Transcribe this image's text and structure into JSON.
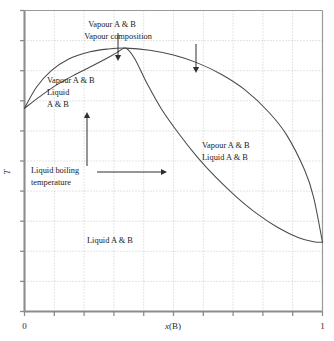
{
  "figure": {
    "kind": "phase-diagram",
    "background": "#ffffff",
    "curve_color": "#4a4a4a",
    "axis_color": "#8c8c8c",
    "grid_color": "#bdbdbd",
    "text_color": "#1a1a1a"
  },
  "axes": {
    "x": {
      "label": "x(B)",
      "label_italic_part": "x",
      "label_rest": "(B)",
      "min_tick_label": "0",
      "max_tick_label": "1",
      "tick_count": 11,
      "tick_values": [
        0,
        0.1,
        0.2,
        0.3,
        0.4,
        0.5,
        0.6,
        0.7,
        0.8,
        0.9,
        1.0
      ]
    },
    "y": {
      "label": "T",
      "tick_count": 11,
      "tick_labels": []
    }
  },
  "annotations": [
    {
      "id": "vapour-ab-top",
      "lines": [
        "Vapour A & B"
      ],
      "x": 112,
      "y": 27,
      "anchor": "middle",
      "arrow": {
        "type": "down",
        "x": 118,
        "y1": 33,
        "y2": 61
      }
    },
    {
      "id": "vapour-composition",
      "lines": [
        "Vapour composition"
      ],
      "x": 118,
      "y": 39,
      "anchor": "middle",
      "arrow": {
        "type": "down",
        "x": 196,
        "y1": 44,
        "y2": 73
      }
    },
    {
      "id": "vapour-liquid-left",
      "lines": [
        "Vapour A & B",
        "Liquid",
        "A & B"
      ],
      "x": 47,
      "y": 83,
      "anchor": "start",
      "arrow": {
        "type": "up",
        "x": 87,
        "y1": 166,
        "y2": 112
      }
    },
    {
      "id": "liquid-boiling-temperature",
      "lines": [
        "Liquid boiling",
        "temperature"
      ],
      "x": 31,
      "y": 173,
      "anchor": "start",
      "arrow": {
        "type": "right",
        "y": 172,
        "x1": 97,
        "x2": 167
      }
    },
    {
      "id": "vapour-liquid-right",
      "lines": [
        "Vapour A & B",
        "Liquid A & B"
      ],
      "x": 202,
      "y": 148,
      "anchor": "start",
      "arrow": null
    },
    {
      "id": "liquid-ab-bottom",
      "lines": [
        "Liquid A & B"
      ],
      "x": 87,
      "y": 243,
      "anchor": "start",
      "arrow": null
    }
  ],
  "chart_data": {
    "type": "line",
    "title": "",
    "xlabel": "x(B)",
    "ylabel": "T",
    "xlim": [
      0,
      1
    ],
    "ylim": [
      0,
      1
    ],
    "grid": true,
    "legend": null,
    "azeotrope": {
      "x": 0.34,
      "label": ""
    },
    "series": [
      {
        "name": "Vapour composition curve",
        "x": [
          0.0,
          0.04,
          0.09,
          0.15,
          0.22,
          0.28,
          0.34,
          0.42,
          0.5,
          0.58,
          0.66,
          0.74,
          0.82,
          0.88,
          0.94,
          0.97,
          1.0
        ],
        "y": [
          0.675,
          0.745,
          0.8,
          0.84,
          0.863,
          0.872,
          0.875,
          0.868,
          0.852,
          0.826,
          0.788,
          0.736,
          0.662,
          0.586,
          0.47,
          0.38,
          0.23
        ]
      },
      {
        "name": "Liquid boiling temperature curve",
        "x": [
          0.0,
          0.05,
          0.1,
          0.16,
          0.22,
          0.27,
          0.31,
          0.34,
          0.37,
          0.41,
          0.46,
          0.52,
          0.58,
          0.64,
          0.71,
          0.78,
          0.85,
          0.92,
          0.97,
          1.0
        ],
        "y": [
          0.675,
          0.713,
          0.748,
          0.782,
          0.812,
          0.838,
          0.86,
          0.875,
          0.84,
          0.76,
          0.672,
          0.588,
          0.513,
          0.448,
          0.382,
          0.325,
          0.279,
          0.245,
          0.232,
          0.23
        ]
      }
    ]
  }
}
